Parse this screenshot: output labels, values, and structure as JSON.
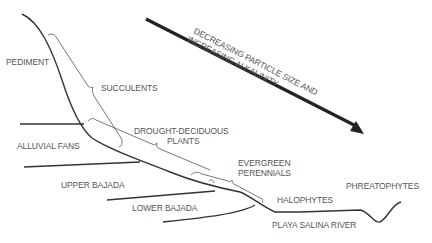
{
  "diagram": {
    "landforms": {
      "pediment": "PEDIMENT",
      "alluvial_fans": "ALLUVIAL FANS",
      "upper_bajada": "UPPER BAJADA",
      "lower_bajada": "LOWER BAJADA",
      "playa_salina_river": "PLAYA SALINA RIVER"
    },
    "vegetation": {
      "succulents": "SUCCULENTS",
      "drought_deciduous_line1": "DROUGHT-DECIDUOUS",
      "drought_deciduous_line2": "PLANTS",
      "evergreen_line1": "EVERGREEN",
      "evergreen_line2": "PERENNIALS",
      "halophytes": "HALOPHYTES",
      "phreatophytes": "PHREATOPHYTES"
    },
    "gradient_arrow": {
      "line1": "DECREASING PARTICLE SIZE AND",
      "line2": "INCREASING ALKALINITY"
    },
    "colors": {
      "line": "#333333",
      "text": "#555555",
      "arrow": "#222222"
    }
  }
}
